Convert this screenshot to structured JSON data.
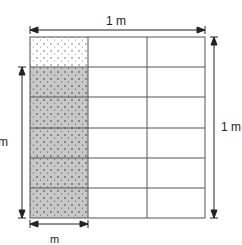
{
  "diagram": {
    "top_label": "1 m",
    "right_label": "1 m",
    "left_label_num": "5",
    "left_label_den": "6",
    "left_label_unit": "m",
    "bottom_label_num": "1",
    "bottom_label_den": "3",
    "bottom_label_unit": "m",
    "grid": {
      "columns": 3,
      "rows": 6,
      "shaded_column": 1,
      "shaded_rows": 5
    },
    "colors": {
      "shade": "#c8c8c8",
      "line": "#555555"
    }
  }
}
